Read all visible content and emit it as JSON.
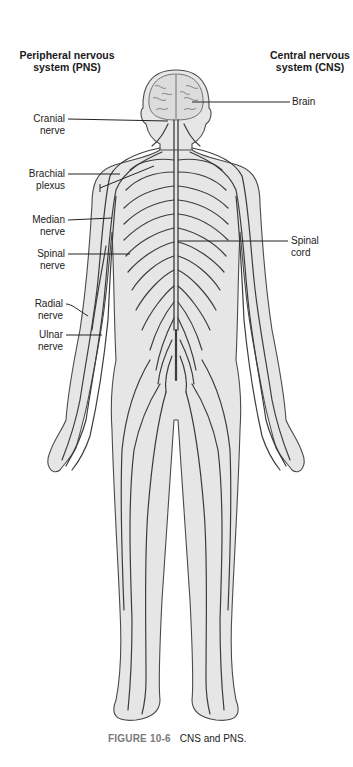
{
  "headers": {
    "pns": [
      "Peripheral nervous",
      "system (PNS)"
    ],
    "cns": [
      "Central nervous",
      "system (CNS)"
    ]
  },
  "labels": {
    "left": [
      {
        "id": "cranial-nerve",
        "lines": [
          "Cranial",
          "nerve"
        ]
      },
      {
        "id": "brachial-plexus",
        "lines": [
          "Brachial",
          "plexus"
        ]
      },
      {
        "id": "median-nerve",
        "lines": [
          "Median",
          "nerve"
        ]
      },
      {
        "id": "spinal-nerve",
        "lines": [
          "Spinal",
          "nerve"
        ]
      },
      {
        "id": "radial-nerve",
        "lines": [
          "Radial",
          "nerve"
        ]
      },
      {
        "id": "ulnar-nerve",
        "lines": [
          "Ulnar",
          "nerve"
        ]
      }
    ],
    "right": [
      {
        "id": "brain",
        "lines": [
          "Brain"
        ]
      },
      {
        "id": "spinal-cord",
        "lines": [
          "Spinal",
          "cord"
        ]
      }
    ]
  },
  "caption": {
    "figure_number": "FIGURE 10-6",
    "text": "CNS and PNS."
  },
  "colors": {
    "body_fill": "#e6e6e6",
    "outline": "#4a4a4a",
    "nerve": "#3c3c3c",
    "figure_number": "#7a7a7a"
  }
}
